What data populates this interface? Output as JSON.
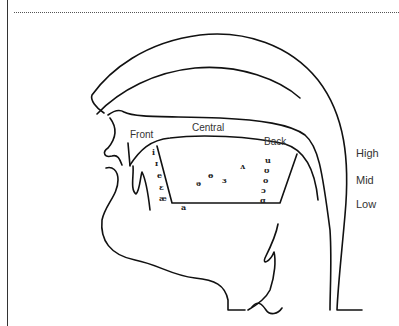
{
  "diagram": {
    "title": "",
    "type": "vowel-chart-on-vocal-tract",
    "labels": {
      "front": "Front",
      "central": "Central",
      "back": "Back"
    },
    "heights": [
      "High",
      "Mid",
      "Low"
    ],
    "vowels": {
      "front": [
        "i",
        "ɪ",
        "e",
        "ɛ",
        "æ"
      ],
      "central": [
        "ɵ",
        "ə",
        "ɜ",
        "ʌ"
      ],
      "bottom": "a",
      "back": [
        "u",
        "ʊ",
        "o",
        "ɔ",
        "ɑ"
      ]
    }
  }
}
